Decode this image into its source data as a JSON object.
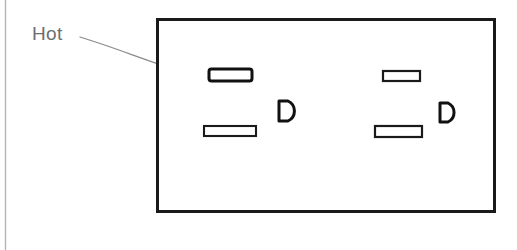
{
  "figure": {
    "background_color": "#ffffff",
    "ink_color": "#1a1a1a",
    "callout_color": "#6e6e6e",
    "page_edge_color": "#b5b5b5"
  },
  "callout": {
    "label": "Hot",
    "label_x": 32,
    "label_y": 40,
    "target": "hot-slot-left",
    "arrow_color": "#7a7a7a"
  },
  "receptacle_plate": {
    "name": "outlet-face-plate",
    "x": 156,
    "y": 18,
    "width": 339,
    "height": 194,
    "stroke_width": 3,
    "fill": "#ffffff"
  },
  "outlets": [
    {
      "name": "outlet-left",
      "hot_slot": {
        "x": 208,
        "y": 68,
        "width": 44,
        "height": 13,
        "label": "hot",
        "stroke_width": 3,
        "rounded": true
      },
      "neutral_slot": {
        "x": 203,
        "y": 125,
        "width": 53,
        "height": 11,
        "label": "neutral",
        "stroke_width": 2,
        "rounded": false
      },
      "ground_hole": {
        "x": 277,
        "y": 100,
        "width": 18,
        "height": 22,
        "label": "ground",
        "stroke_width": 3
      }
    },
    {
      "name": "outlet-right",
      "hot_slot": {
        "x": 382,
        "y": 70,
        "width": 38,
        "height": 11,
        "label": "hot",
        "stroke_width": 2,
        "rounded": false
      },
      "neutral_slot": {
        "x": 374,
        "y": 125,
        "width": 48,
        "height": 12,
        "label": "neutral",
        "stroke_width": 2,
        "rounded": false
      },
      "ground_hole": {
        "x": 438,
        "y": 102,
        "width": 17,
        "height": 21,
        "label": "ground",
        "stroke_width": 3
      }
    }
  ],
  "caption_fragment": {
    "text": "",
    "note": "caption below figure is cropped off at the bottom image edge"
  }
}
